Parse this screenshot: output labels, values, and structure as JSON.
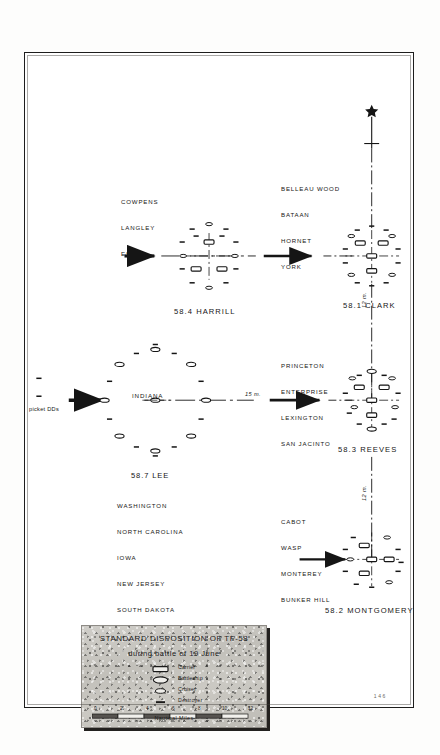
{
  "plate": {
    "page_number": "146"
  },
  "legend": {
    "title_line1": "STANDARD DISPOSITION OF TF-58",
    "title_line2": "during battle of 19 June",
    "keys": [
      {
        "symbol": "carrier-symbol",
        "label": "Carrier"
      },
      {
        "symbol": "battleship-symbol",
        "label": "Battleship"
      },
      {
        "symbol": "cruiser-symbol",
        "label": "Cruiser"
      },
      {
        "symbol": "destroyer-symbol",
        "label": "Destroyer"
      }
    ],
    "scale": {
      "unit_label": "Nautical Miles",
      "ticks": [
        "0",
        "2",
        "4",
        "6",
        "8",
        "10",
        "12"
      ]
    }
  },
  "annotations": {
    "picket_dds": "picket DDs",
    "distance_center": "15 m.",
    "distance_clark_reeves": "12 m.",
    "distance_reeves_montgomery": "12 m."
  },
  "task_groups": [
    {
      "id": "tg-58-4-harrill",
      "designation": "58.4 HARRILL",
      "ships": [
        "COWPENS",
        "LANGLEY",
        "ESSEX"
      ]
    },
    {
      "id": "tg-58-1-clark",
      "designation": "58.1 CLARK",
      "ships": [
        "BELLEAU WOOD",
        "BATAAN",
        "HORNET",
        "YORK"
      ]
    },
    {
      "id": "tg-58-7-lee",
      "designation": "58.7 LEE",
      "center_ship": "INDIANA",
      "ships": [
        "WASHINGTON",
        "NORTH CAROLINA",
        "IOWA",
        "NEW JERSEY",
        "SOUTH DAKOTA",
        "ALABAMA"
      ]
    },
    {
      "id": "tg-58-3-reeves",
      "designation": "58.3 REEVES",
      "ships": [
        "PRINCETON",
        "ENTERPRISE",
        "LEXINGTON",
        "SAN JACINTO"
      ]
    },
    {
      "id": "tg-58-2-montgomery",
      "designation": "58.2 MONTGOMERY",
      "ships": [
        "CABOT",
        "WASP",
        "MONTEREY",
        "BUNKER HILL"
      ]
    }
  ],
  "colors": {
    "ink": "#151515",
    "paper": "#ffffff",
    "legend_grey": "#c6c4be"
  }
}
